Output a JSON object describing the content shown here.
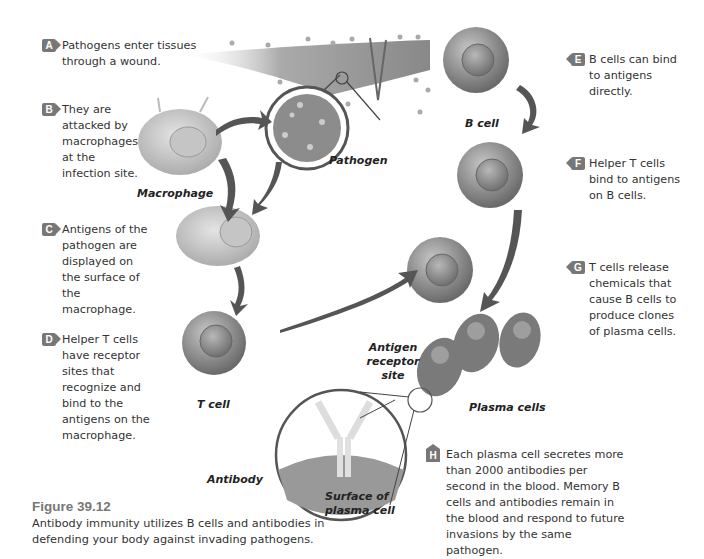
{
  "figure": {
    "number": "Figure 39.12",
    "caption": "Antibody immunity utilizes B cells and antibodies in defending your body against invading pathogens."
  },
  "steps": [
    {
      "letter": "A",
      "text": "Pathogens enter tissues through a wound."
    },
    {
      "letter": "B",
      "text": "They are attacked by macrophages at the infection site."
    },
    {
      "letter": "C",
      "text": "Antigens of the pathogen are displayed on the surface of the macrophage."
    },
    {
      "letter": "D",
      "text": "Helper T cells have receptor sites that recognize and bind to the antigens on the macrophage."
    },
    {
      "letter": "E",
      "text": "B cells can bind to antigens directly."
    },
    {
      "letter": "F",
      "text": "Helper T cells bind to antigens on B cells."
    },
    {
      "letter": "G",
      "text": "T cells release chemicals that cause B cells to produce clones of plasma cells."
    },
    {
      "letter": "H",
      "text": "Each plasma cell secretes more than 2000 antibodies per second in the blood. Memory B cells and antibodies remain in the blood and respond to future invasions by the same pathogen."
    }
  ],
  "labels": {
    "macrophage": "Macrophage",
    "pathogen": "Pathogen",
    "b_cell": "B cell",
    "t_cell": "T cell",
    "antigen_receptor_site": "Antigen receptor site",
    "plasma_cells": "Plasma cells",
    "antibody": "Antibody",
    "surface_of_plasma_cell": "Surface of plasma cell"
  },
  "colors": {
    "badge": "#777777",
    "arrow": "#555555",
    "cell": "#8a8a8a",
    "text": "#333333"
  }
}
